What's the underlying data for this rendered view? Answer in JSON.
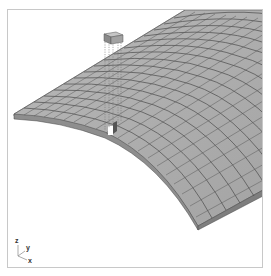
{
  "figure": {
    "colors": {
      "frame": "#c8c8c8",
      "block_face": "#b4b4b4",
      "block_top": "#a9a9a9",
      "mortar_lines": "#4a4a4a",
      "side_face": "#8a8a8a",
      "background": "#ffffff"
    }
  },
  "axes": {
    "z_label": "z",
    "y_label": "y",
    "x_label": "x"
  },
  "detached_block": {
    "guide_style": "dotted"
  }
}
